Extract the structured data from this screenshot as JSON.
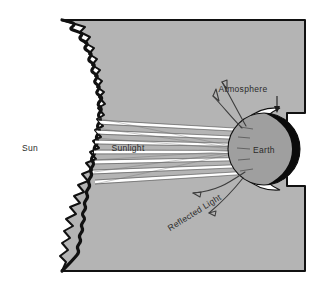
{
  "figure": {
    "background_color": "#ffffff",
    "panel_color": "#b4b4b4",
    "outline_color": "#111111",
    "ray_color": "#ffffff",
    "shadow_color": "#0b0b0b",
    "earth_color": "#9f9f9f",
    "atmosphere_color": "#ffffff",
    "text_color": "#2b2b2b"
  },
  "labels": {
    "sun": "Sun",
    "sunlight": "Sunlight",
    "atmosphere": "Atmosphere",
    "earth": "Earth",
    "reflected_light": "Reflected Light"
  },
  "diagram_data": {
    "type": "diagram",
    "subject": "solar illumination of the Earth",
    "elements": [
      {
        "name": "sun",
        "label": "Sun",
        "position": "left",
        "rendering": "large grey body with irregular flame-like limb",
        "label_position": {
          "x": 22,
          "y": 148
        }
      },
      {
        "name": "sunlight-rays",
        "label": "Sunlight",
        "count": 7,
        "description": "parallel white ray bands fanning from the Sun's limb to the Earth's lit limb",
        "label_position": {
          "x": 128,
          "y": 148
        }
      },
      {
        "name": "earth",
        "label": "Earth",
        "position": "right",
        "rendering": "grey disk with black shadow on its night side",
        "label_position": {
          "x": 258,
          "y": 150
        }
      },
      {
        "name": "atmosphere",
        "label": "Atmosphere",
        "rendering": "white crescent ring around the Earth's sunlit limb",
        "label_position": {
          "x": 243,
          "y": 90
        },
        "pointer_to": {
          "x": 277,
          "y": 112
        }
      },
      {
        "name": "reflected-light",
        "label": "Reflected Light",
        "rendering": "arrows leaving the Earth back toward the Sun side",
        "arrow_count": 4,
        "label_position": {
          "x": 196,
          "y": 215
        },
        "label_rotation_degrees": -32
      }
    ]
  }
}
